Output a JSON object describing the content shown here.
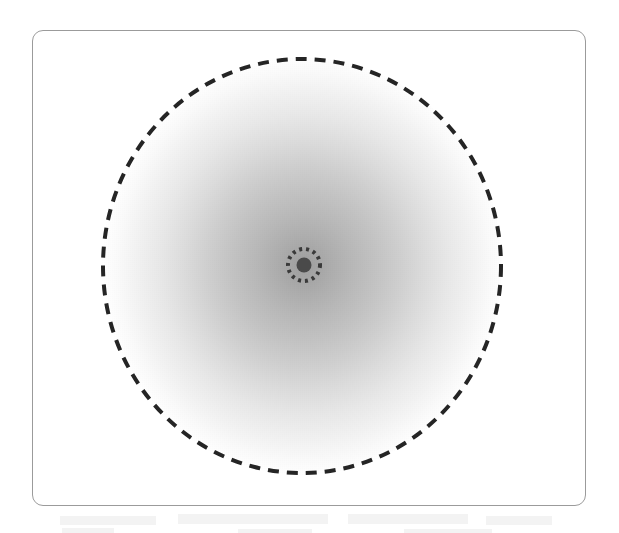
{
  "figure": {
    "kind": "radial-zone-diagram",
    "caption": "",
    "canvas": {
      "width": 619,
      "height": 533,
      "background": "#ffffff"
    },
    "frame": {
      "name": "figure-border",
      "x": 32,
      "y": 30,
      "width": 554,
      "height": 476,
      "corner_radius": 11,
      "stroke_color": "#9b9b9b",
      "stroke_width": 1,
      "fill": "#ffffff"
    },
    "gradient_field": {
      "name": "radial-gradient-blob",
      "center_x": 301,
      "center_y": 265,
      "radius_x": 200,
      "radius_y": 209,
      "center_color": "#9e9e9e",
      "edge_color": "#ffffff",
      "description": "intensity falls off smoothly from the core outward, reaching the page white at the dashed boundary"
    },
    "outer_circle": {
      "name": "outer-dashed-circle",
      "center_x": 301,
      "center_y": 265,
      "radius_x": 199,
      "radius_y": 207,
      "stroke_color": "#252525",
      "stroke_width": 4,
      "dash_length": 11,
      "dash_gap": 8,
      "style": "dashed"
    },
    "inner_circle": {
      "name": "inner-dotted-circle",
      "center_x": 303,
      "center_y": 264,
      "radius": 16,
      "stroke_color": "#3a3a3a",
      "stroke_width": 4,
      "dash_length": 3,
      "dash_gap": 4,
      "style": "dotted",
      "dot_count": 15
    },
    "center_dot": {
      "name": "center-core-dot",
      "center_x": 303,
      "center_y": 264,
      "radius": 7.5,
      "fill_color": "#4a4a4a",
      "style": "filled"
    },
    "scan_artifacts": {
      "name": "page-showthrough-ghosting",
      "present": true,
      "opacity_note": "very faint grey smudges along the lower margin, below the frame",
      "color": "#e2e2e2",
      "bands": [
        {
          "x": 60,
          "y": 516,
          "width": 96,
          "height": 9
        },
        {
          "x": 178,
          "y": 514,
          "width": 150,
          "height": 10
        },
        {
          "x": 348,
          "y": 514,
          "width": 120,
          "height": 10
        },
        {
          "x": 486,
          "y": 516,
          "width": 66,
          "height": 9
        },
        {
          "x": 62,
          "y": 528,
          "width": 52,
          "height": 5
        },
        {
          "x": 238,
          "y": 529,
          "width": 74,
          "height": 5
        },
        {
          "x": 404,
          "y": 529,
          "width": 88,
          "height": 5
        }
      ]
    }
  }
}
